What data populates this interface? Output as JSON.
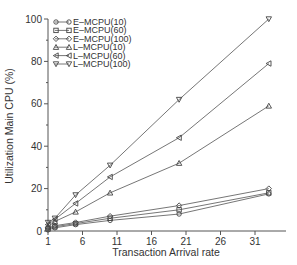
{
  "chart_data": {
    "type": "line",
    "title": "",
    "xlabel": "Transaction Arrival rate",
    "ylabel": "Utilization Main CPU (%)",
    "xlim": [
      1,
      35.5
    ],
    "ylim": [
      0,
      100
    ],
    "x_ticks": [
      1,
      6,
      11,
      16,
      21,
      26,
      31
    ],
    "y_ticks": [
      0,
      20,
      40,
      60,
      80,
      100
    ],
    "grid": false,
    "legend_position": "upper-left",
    "x": [
      1,
      2,
      5,
      10,
      20,
      33
    ],
    "series": [
      {
        "name": "E-MCPU(10)",
        "marker": "circle",
        "values": [
          0.5,
          1.5,
          3,
          5,
          8,
          17.5
        ]
      },
      {
        "name": "E-MCPU(60)",
        "marker": "square",
        "values": [
          1,
          2,
          3.5,
          6,
          10,
          18
        ]
      },
      {
        "name": "E-MCPU(100)",
        "marker": "diamond",
        "values": [
          1.5,
          2.5,
          4,
          7,
          12,
          20
        ]
      },
      {
        "name": "L-MCPU(10)",
        "marker": "triangle-up",
        "values": [
          2,
          4.5,
          9,
          18,
          32,
          59
        ]
      },
      {
        "name": "L-MCPU(60)",
        "marker": "triangle-left",
        "values": [
          3,
          5.5,
          13,
          25.5,
          44,
          79
        ]
      },
      {
        "name": "L-MCPU(100)",
        "marker": "triangle-down",
        "values": [
          4,
          6,
          17,
          31,
          62,
          100
        ]
      }
    ]
  },
  "colors": {
    "line": "#666666",
    "axis": "#555555",
    "text": "#333333"
  }
}
